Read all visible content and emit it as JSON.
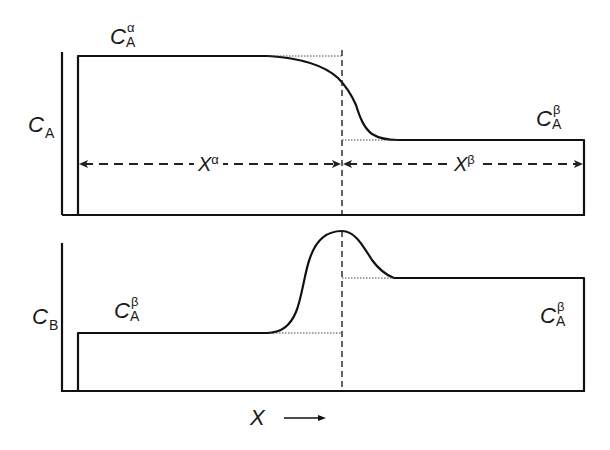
{
  "figure": {
    "top_panel": {
      "y_axis_label": {
        "main": "C",
        "sub": "A"
      },
      "level_left_label": {
        "main": "C",
        "sup": "α",
        "sub": "A"
      },
      "level_right_label": {
        "main": "C",
        "sup": "β",
        "sub": "A"
      },
      "region_left_label": {
        "main": "X",
        "sup": "α"
      },
      "region_right_label": {
        "main": "X",
        "sup": "β"
      }
    },
    "bottom_panel": {
      "y_axis_label": {
        "main": "C",
        "sub": "B"
      },
      "level_left_label": {
        "main": "C",
        "sup": "β",
        "sub": "A"
      },
      "level_right_label": {
        "main": "C",
        "sup": "β",
        "sub": "A"
      }
    },
    "x_axis_label": "X",
    "x_axis_arrow": "→",
    "line_color": "#111111"
  }
}
